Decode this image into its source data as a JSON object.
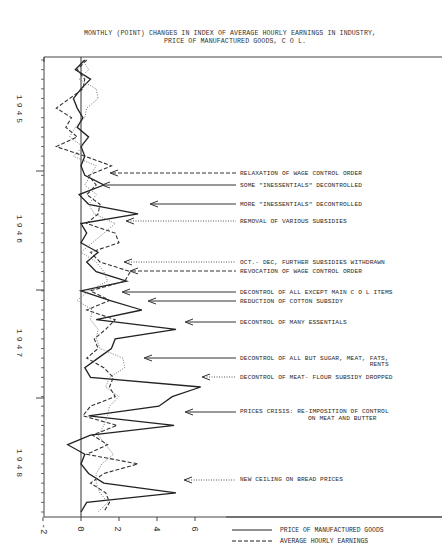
{
  "chart_data": {
    "type": "line",
    "orientation": "vertical-time-axis",
    "title": "MONTHLY (POINT) CHANGES IN INDEX OF AVERAGE HOURLY EARNINGS IN INDUSTRY,",
    "title_line2": "PRICE OF MANUFACTURED GOODS, C O L.",
    "xlabel": "",
    "ylabel": "",
    "xlim": [
      -2,
      8
    ],
    "x_ticks": [
      "-2",
      "0",
      "2",
      "4",
      "6"
    ],
    "year_labels": [
      "1945",
      "1946",
      "1947",
      "1948"
    ],
    "grid": false,
    "months": 48,
    "series": [
      {
        "name": "PRICE OF MANUFACTURED GOODS",
        "style": "solid",
        "values": [
          0.2,
          -0.3,
          0.5,
          0.0,
          -0.4,
          -0.2,
          0.1,
          -0.2,
          0.4,
          0.0,
          0.2,
          0.0,
          0.2,
          1.2,
          -0.1,
          0.4,
          3.0,
          0.0,
          0.3,
          0.0,
          0.9,
          0.3,
          0.8,
          2.4,
          0.0,
          1.5,
          3.2,
          0.8,
          5.0,
          1.8,
          1.6,
          0.9,
          0.2,
          0.5,
          6.3,
          4.8,
          4.1,
          0.4,
          4.9,
          0.5,
          -0.7,
          0.2,
          0.0,
          0.4,
          1.2,
          5.0,
          0.3,
          0.0
        ]
      },
      {
        "name": "AVERAGE HOURLY EARNINGS",
        "style": "dashed",
        "values": [
          0.3,
          -0.2,
          0.2,
          0.1,
          -0.6,
          -1.3,
          -0.5,
          -0.8,
          -0.2,
          -1.3,
          0.2,
          1.6,
          0.4,
          0.8,
          0.3,
          1.0,
          0.9,
          0.3,
          1.8,
          2.0,
          0.5,
          1.0,
          2.6,
          2.3,
          0.5,
          1.5,
          0.3,
          1.8,
          1.3,
          0.7,
          0.9,
          0.3,
          1.2,
          1.7,
          1.5,
          1.8,
          0.5,
          0.1,
          1.9,
          0.6,
          1.4,
          0.3,
          3.0,
          1.2,
          0.5,
          1.3,
          1.5,
          1.2
        ]
      },
      {
        "name": "COST OF LIVING",
        "style": "dotted",
        "values": [
          0.1,
          0.4,
          -0.1,
          0.8,
          0.9,
          0.3,
          0.2,
          -0.3,
          -0.6,
          0.1,
          -0.4,
          0.8,
          0.5,
          0.2,
          0.8,
          0.4,
          0.7,
          1.8,
          1.2,
          0.6,
          0.0,
          0.8,
          1.2,
          1.4,
          0.4,
          -0.2,
          0.6,
          0.5,
          0.9,
          0.8,
          1.0,
          2.2,
          2.3,
          1.5,
          1.3,
          2.0,
          1.5,
          1.4,
          1.2,
          0.9,
          1.3,
          1.7,
          1.1,
          0.8,
          0.8,
          1.0,
          1.4,
          0.9
        ]
      }
    ],
    "annotations": [
      {
        "text": "RELAXATION OF WAGE CONTROL ORDER",
        "arrow_style": "dashed"
      },
      {
        "text": "SOME \"INESSENTIALS\" DECONTROLLED",
        "arrow_style": "solid"
      },
      {
        "text": "MORE \"INESSENTIALS\" DECONTROLLED",
        "arrow_style": "solid"
      },
      {
        "text": "REMOVAL OF VARIOUS SUBSIDIES",
        "arrow_style": "dotted"
      },
      {
        "text": "OCT.- DEC, FURTHER SUBSIDIES WITHDRAWN",
        "arrow_style": "dotted"
      },
      {
        "text": "REVOCATION OF WAGE CONTROL ORDER",
        "arrow_style": "dashed"
      },
      {
        "text": "DECONTROL OF ALL EXCEPT MAIN C O L ITEMS",
        "arrow_style": "solid"
      },
      {
        "text": "REDUCTION OF COTTON SUBSIDY",
        "arrow_style": "solid"
      },
      {
        "text": "DECONTROL OF MANY ESSENTIALS",
        "arrow_style": "solid"
      },
      {
        "text": "DECONTROL OF ALL BUT SUGAR, MEAT, FATS,",
        "text_line2": "RENTS",
        "arrow_style": "solid"
      },
      {
        "text": "DECONTROL OF MEAT- FLOUR SUBSIDY DROPPED",
        "arrow_style": "dotted"
      },
      {
        "text": "PRICES CRISIS: RE-IMPOSITION OF CONTROL",
        "text_line2": "ON MEAT AND BUTTER",
        "arrow_style": "solid"
      },
      {
        "text": "NEW CEILING ON BREAD PRICES",
        "arrow_style": "dotted"
      }
    ],
    "legend": {
      "position": "bottom-right",
      "entries": [
        {
          "label": "PRICE OF MANUFACTURED GOODS",
          "style": "solid"
        },
        {
          "label": "AVERAGE HOURLY EARNINGS",
          "style": "dashed"
        }
      ]
    }
  }
}
